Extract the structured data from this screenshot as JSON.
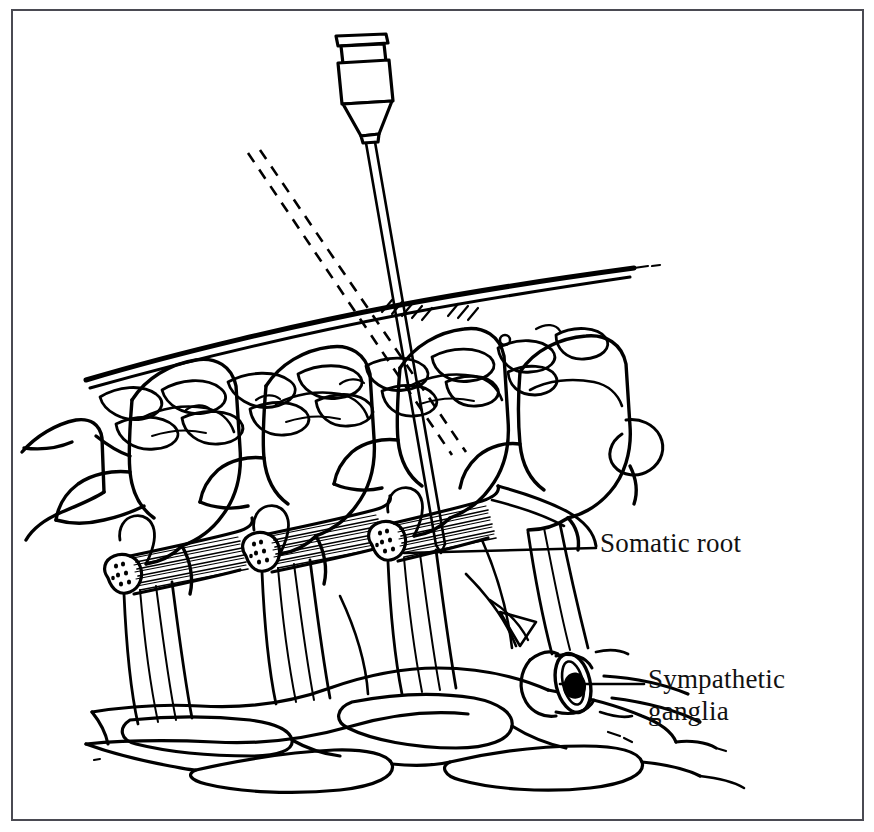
{
  "figure": {
    "domain": "medical-illustration",
    "title": "",
    "background_color": "#ffffff",
    "ink_color": "#000000",
    "frame": {
      "border_color": "#4a4a52",
      "border_width_px": 2,
      "x": 11,
      "y": 9,
      "width": 853,
      "height": 812
    }
  },
  "labels": [
    {
      "id": "somatic-root",
      "text": "Somatic root",
      "x": 600,
      "y": 528,
      "lines": [
        "Somatic root"
      ],
      "leader_line": {
        "from_x": 596,
        "from_y": 546,
        "to_x": 404,
        "to_y": 553
      }
    },
    {
      "id": "sympathetic-ganglia",
      "text": "Sympathetic\nganglia",
      "x": 648,
      "y": 664,
      "lines": [
        "Sympathetic",
        "ganglia"
      ],
      "leader_line": {
        "from_x": 644,
        "from_y": 684,
        "to_x": 570,
        "to_y": 684
      }
    }
  ],
  "structures": [
    {
      "name": "needle-hub",
      "note": "tapered plastic hub with flange at top of needle"
    },
    {
      "name": "needle-shaft",
      "note": "long thin double-line shaft angled down and slightly right"
    },
    {
      "name": "trajectory-dashed-lines",
      "note": "two parallel dashed lines showing alternate needle path"
    },
    {
      "name": "skin-surface",
      "note": "double contour line sloping down to the left"
    },
    {
      "name": "subcutaneous-fat",
      "note": "row of rounded lobules beneath the skin"
    },
    {
      "name": "vertebrae",
      "note": "four transverse processes / vertebral bodies in oblique view"
    },
    {
      "name": "somatic-nerve-roots",
      "note": "three hatched cut nerve-root stumps emerging laterally"
    },
    {
      "name": "nerve-fiber-bundles",
      "note": "vertical striated fiber bundles descending from each root"
    },
    {
      "name": "sympathetic-chain",
      "note": "elongated ganglia linked by rami along the bottom"
    },
    {
      "name": "ganglion-cut-end",
      "note": "oval cut cross-section of the sympathetic chain at right"
    }
  ]
}
